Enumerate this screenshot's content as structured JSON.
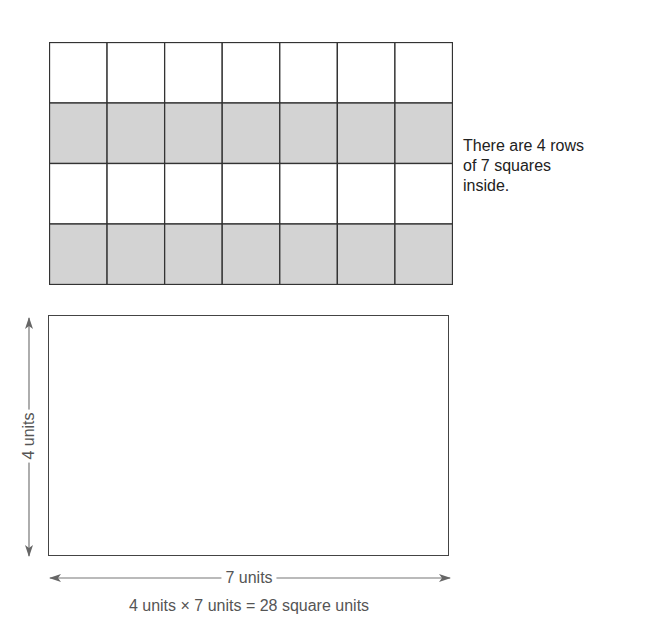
{
  "grid": {
    "rows": 4,
    "cols": 7,
    "row_fills": [
      "#ffffff",
      "#d3d3d3",
      "#ffffff",
      "#d3d3d3"
    ],
    "line_color": "#333333"
  },
  "side_text": {
    "lines": [
      "There are 4 rows",
      "of 7 squares",
      "inside."
    ]
  },
  "rectangle": {
    "height_label": "4 units",
    "width_label": "7 units"
  },
  "equation": "4 units × 7 units = 28 square units"
}
